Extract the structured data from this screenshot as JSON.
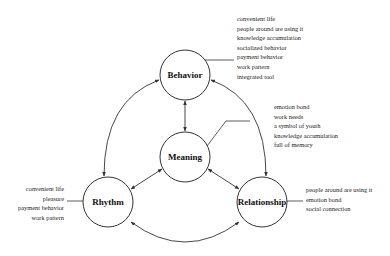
{
  "diagram": {
    "nodes": {
      "behavior": {
        "label": "Behavior",
        "cx": 185,
        "cy": 75,
        "r": 25
      },
      "meaning": {
        "label": "Meaning",
        "cx": 185,
        "cy": 157,
        "r": 25
      },
      "rhythm": {
        "label": "Rhythm",
        "cx": 108,
        "cy": 202,
        "r": 25
      },
      "relationship": {
        "label": "Relationship",
        "cx": 262,
        "cy": 202,
        "r": 25
      }
    },
    "notes": {
      "behavior": [
        "convenient life",
        "people around are using it",
        "knowledge accumulation",
        "socialized behavior",
        "payment behavior",
        "work pattern",
        "integrated tool"
      ],
      "meaning": [
        "emotion bond",
        "work needs",
        "a symbol of youth",
        "knowledge accumulation",
        "full of memory"
      ],
      "rhythm": [
        "convenient life",
        "pleasure",
        "payment behavior",
        "work pattern"
      ],
      "relationship": [
        "people around are using it",
        "emotion bond",
        "social connection"
      ]
    },
    "edges": [
      {
        "from": "Behavior",
        "to": "Meaning",
        "type": "bidirectional"
      },
      {
        "from": "Meaning",
        "to": "Rhythm",
        "type": "bidirectional"
      },
      {
        "from": "Meaning",
        "to": "Relationship",
        "type": "bidirectional"
      },
      {
        "from": "Behavior",
        "to": "Rhythm",
        "type": "bidirectional-arc"
      },
      {
        "from": "Behavior",
        "to": "Relationship",
        "type": "bidirectional-arc"
      },
      {
        "from": "Rhythm",
        "to": "Relationship",
        "type": "bidirectional-arc"
      }
    ],
    "colors": {
      "stroke": "#333333",
      "text": "#222222",
      "background": "#ffffff"
    }
  }
}
